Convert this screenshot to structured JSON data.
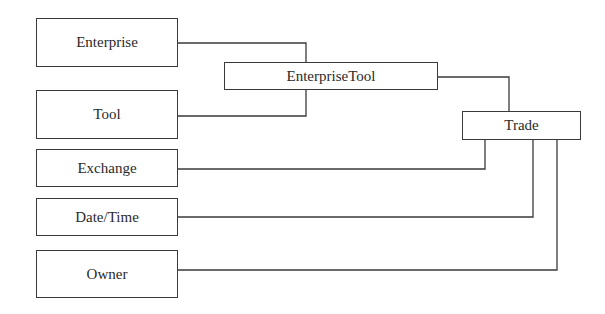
{
  "diagram": {
    "nodes": [
      {
        "id": "enterprise",
        "label": "Enterprise",
        "x": 36,
        "y": 18,
        "w": 142,
        "h": 49
      },
      {
        "id": "tool",
        "label": "Tool",
        "x": 36,
        "y": 90,
        "w": 142,
        "h": 49
      },
      {
        "id": "exchange",
        "label": "Exchange",
        "x": 36,
        "y": 149,
        "w": 142,
        "h": 38
      },
      {
        "id": "datetime",
        "label": "Date/Time",
        "x": 36,
        "y": 198,
        "w": 142,
        "h": 38
      },
      {
        "id": "owner",
        "label": "Owner",
        "x": 36,
        "y": 250,
        "w": 142,
        "h": 48
      },
      {
        "id": "enterprisetool",
        "label": "EnterpriseTool",
        "x": 224,
        "y": 62,
        "w": 214,
        "h": 28
      },
      {
        "id": "trade",
        "label": "Trade",
        "x": 462,
        "y": 111,
        "w": 119,
        "h": 29
      }
    ],
    "edges": [
      {
        "from": "enterprise",
        "to": "enterprisetool"
      },
      {
        "from": "tool",
        "to": "enterprisetool"
      },
      {
        "from": "enterprisetool",
        "to": "trade"
      },
      {
        "from": "exchange",
        "to": "trade"
      },
      {
        "from": "datetime",
        "to": "trade"
      },
      {
        "from": "owner",
        "to": "trade"
      }
    ],
    "line_color": "#3a3a3a"
  }
}
